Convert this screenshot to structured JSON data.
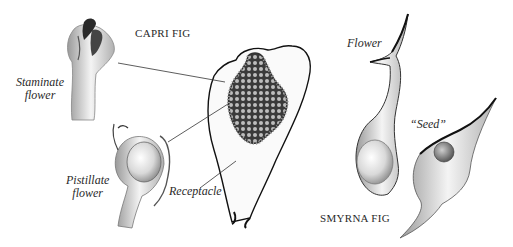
{
  "figure": {
    "headings": {
      "capri_fig": "CAPRI FIG",
      "smyrna_fig": "SMYRNA FIG"
    },
    "labels": {
      "staminate_line1": "Staminate",
      "staminate_line2": "flower",
      "pistillate_line1": "Pistillate",
      "pistillate_line2": "flower",
      "receptacle": "Receptacle",
      "flower": "Flower",
      "seed": "“Seed”"
    },
    "colors": {
      "ink": "#222222",
      "shade_light": "#d8d8d8",
      "shade_mid": "#a9a9a9",
      "shade_dark": "#555555",
      "background": "#ffffff"
    }
  }
}
